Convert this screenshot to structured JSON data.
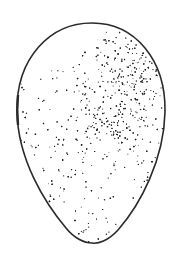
{
  "figure": {
    "background": "#ffffff",
    "outline_color": "#2a2a2a",
    "stipple_color": "#1e1e1e",
    "highlight": "upper-left",
    "shadow": "upper-right"
  }
}
